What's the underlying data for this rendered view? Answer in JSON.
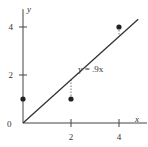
{
  "chart_data": {
    "type": "scatter",
    "title": "",
    "xlabel": "x",
    "ylabel": "y",
    "xlim": [
      0,
      4.9
    ],
    "ylim": [
      0,
      4.7
    ],
    "x_ticks": [
      2,
      4
    ],
    "x_tick_labels": [
      "2",
      "4"
    ],
    "y_ticks": [
      2,
      4
    ],
    "y_tick_labels": [
      "2",
      "4"
    ],
    "origin_label": "0",
    "grid": false,
    "points": [
      {
        "x": 0,
        "y": 1
      },
      {
        "x": 2,
        "y": 1
      },
      {
        "x": 4,
        "y": 4
      }
    ],
    "fit_line": {
      "slope": 0.9,
      "intercept": 0,
      "x_range": [
        0,
        4.8
      ],
      "label": "y = .9x"
    },
    "residuals_shown": true,
    "colors": {
      "axis": "#444444",
      "line": "#333333",
      "point": "#222222",
      "residual": "#555555"
    }
  }
}
